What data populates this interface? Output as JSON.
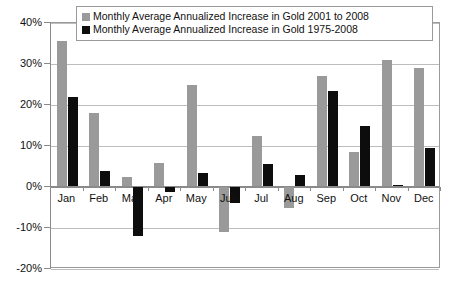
{
  "chart_data": {
    "type": "bar",
    "title": "",
    "xlabel": "",
    "ylabel": "",
    "ylim": [
      -20,
      40
    ],
    "ytick_step": 10,
    "ytick_labels": [
      "40%",
      "30%",
      "20%",
      "10%",
      "0%",
      "-10%",
      "-20%"
    ],
    "ytick_values": [
      40,
      30,
      20,
      10,
      0,
      -10,
      -20
    ],
    "grid": true,
    "legend_position": "top-center",
    "categories": [
      "Jan",
      "Feb",
      "Mar",
      "Apr",
      "May",
      "Jun",
      "Jul",
      "Aug",
      "Sep",
      "Oct",
      "Nov",
      "Dec"
    ],
    "series": [
      {
        "name": "Monthly Average Annualized Increase in Gold 2001 to 2008",
        "color": "#9a9a9a",
        "values": [
          35.5,
          18.0,
          2.5,
          5.8,
          25.0,
          -11.0,
          12.5,
          -5.0,
          27.0,
          8.5,
          31.0,
          29.0
        ]
      },
      {
        "name": "Monthly Average Annualized Increase in Gold 1975-2008",
        "color": "#0d0d0d",
        "values": [
          22.0,
          4.0,
          -12.0,
          -1.2,
          3.5,
          -4.0,
          5.5,
          3.0,
          23.5,
          15.0,
          0.5,
          9.5
        ]
      }
    ]
  },
  "legend": {
    "items": [
      {
        "label": "Monthly Average Annualized Increase in Gold 2001 to 2008",
        "swatch": "#9a9a9a"
      },
      {
        "label": "Monthly Average Annualized Increase in Gold 1975-2008",
        "swatch": "#0d0d0d"
      }
    ]
  },
  "colors": {
    "series_2001_2008": "#9a9a9a",
    "series_1975_2008": "#0d0d0d",
    "gridline": "#bdbdbd",
    "axis": "#8a8a8a",
    "background": "#ffffff",
    "text": "#111111"
  }
}
